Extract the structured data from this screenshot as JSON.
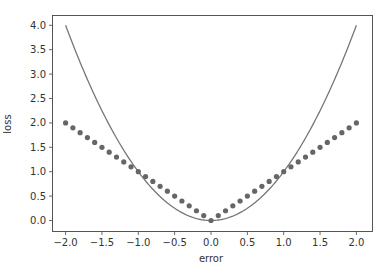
{
  "chart_data": {
    "type": "line+scatter",
    "title": "",
    "xlabel": "error",
    "ylabel": "loss",
    "xlim": [
      -2.2,
      2.2
    ],
    "ylim": [
      -0.2,
      4.2
    ],
    "grid": false,
    "legend": null,
    "x_ticks": [
      -2.0,
      -1.5,
      -1.0,
      -0.5,
      0.0,
      0.5,
      1.0,
      1.5,
      2.0
    ],
    "x_tick_labels": [
      "−2.0",
      "−1.5",
      "−1.0",
      "−0.5",
      "0.0",
      "0.5",
      "1.0",
      "1.5",
      "2.0"
    ],
    "y_ticks": [
      0.0,
      0.5,
      1.0,
      1.5,
      2.0,
      2.5,
      3.0,
      3.5,
      4.0
    ],
    "y_tick_labels": [
      "0.0",
      "0.5",
      "1.0",
      "1.5",
      "2.0",
      "2.5",
      "3.0",
      "3.5",
      "4.0"
    ],
    "series": [
      {
        "name": "squared error",
        "type": "line",
        "color": "#777777",
        "function": "x^2",
        "x_range": [
          -2.0,
          2.0
        ],
        "x": [
          -2.0,
          -1.8,
          -1.6,
          -1.4,
          -1.2,
          -1.0,
          -0.8,
          -0.6,
          -0.4,
          -0.2,
          0.0,
          0.2,
          0.4,
          0.6,
          0.8,
          1.0,
          1.2,
          1.4,
          1.6,
          1.8,
          2.0
        ],
        "values": [
          4.0,
          3.24,
          2.56,
          1.96,
          1.44,
          1.0,
          0.64,
          0.36,
          0.16,
          0.04,
          0.0,
          0.04,
          0.16,
          0.36,
          0.64,
          1.0,
          1.44,
          1.96,
          2.56,
          3.24,
          4.0
        ]
      },
      {
        "name": "absolute error",
        "type": "scatter",
        "color": "#666666",
        "function": "|x|",
        "x": [
          -2.0,
          -1.9,
          -1.8,
          -1.7,
          -1.6,
          -1.5,
          -1.4,
          -1.3,
          -1.2,
          -1.1,
          -1.0,
          -0.9,
          -0.8,
          -0.7,
          -0.6,
          -0.5,
          -0.4,
          -0.3,
          -0.2,
          -0.1,
          0.0,
          0.1,
          0.2,
          0.3,
          0.4,
          0.5,
          0.6,
          0.7,
          0.8,
          0.9,
          1.0,
          1.1,
          1.2,
          1.3,
          1.4,
          1.5,
          1.6,
          1.7,
          1.8,
          1.9,
          2.0
        ],
        "values": [
          2.0,
          1.9,
          1.8,
          1.7,
          1.6,
          1.5,
          1.4,
          1.3,
          1.2,
          1.1,
          1.0,
          0.9,
          0.8,
          0.7,
          0.6,
          0.5,
          0.4,
          0.3,
          0.2,
          0.1,
          0.0,
          0.1,
          0.2,
          0.3,
          0.4,
          0.5,
          0.6,
          0.7,
          0.8,
          0.9,
          1.0,
          1.1,
          1.2,
          1.3,
          1.4,
          1.5,
          1.6,
          1.7,
          1.8,
          1.9,
          2.0
        ]
      }
    ]
  }
}
